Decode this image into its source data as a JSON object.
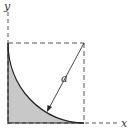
{
  "labels": {
    "y_axis": "y",
    "x_axis": "x",
    "radius": "a"
  },
  "colors": {
    "shade": "#c8c8c8",
    "line": "#222222",
    "dash": "#555555"
  }
}
